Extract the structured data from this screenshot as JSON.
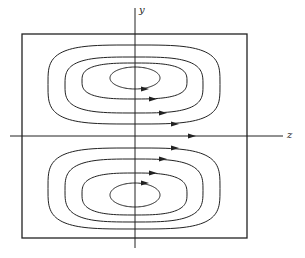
{
  "figure": {
    "axes": {
      "vertical_label": "y",
      "horizontal_label": "z"
    },
    "caption_text": "",
    "box": {
      "x": 22,
      "y": 34,
      "width": 225,
      "height": 204
    },
    "vortices": [
      {
        "name": "upper",
        "loops": [
          {
            "left": 48,
            "right": 220,
            "top": 45,
            "bottom": 124,
            "arrow_x": 175
          },
          {
            "left": 65,
            "right": 203,
            "top": 57,
            "bottom": 113,
            "arrow_x": 163
          },
          {
            "left": 82,
            "right": 187,
            "top": 63,
            "bottom": 99,
            "arrow_x": 153
          },
          {
            "left": 110,
            "right": 160,
            "top": 67,
            "bottom": 89,
            "arrow_x": 145
          }
        ]
      },
      {
        "name": "lower",
        "loops": [
          {
            "left": 48,
            "right": 220,
            "top": 148,
            "bottom": 229,
            "arrow_x": 175
          },
          {
            "left": 65,
            "right": 203,
            "top": 159,
            "bottom": 222,
            "arrow_x": 163
          },
          {
            "left": 82,
            "right": 187,
            "top": 173,
            "bottom": 215,
            "arrow_x": 153
          },
          {
            "left": 110,
            "right": 160,
            "top": 183,
            "bottom": 207,
            "arrow_x": 145
          }
        ]
      }
    ],
    "axis_arrow_x": 192,
    "line_color": "#222222"
  }
}
